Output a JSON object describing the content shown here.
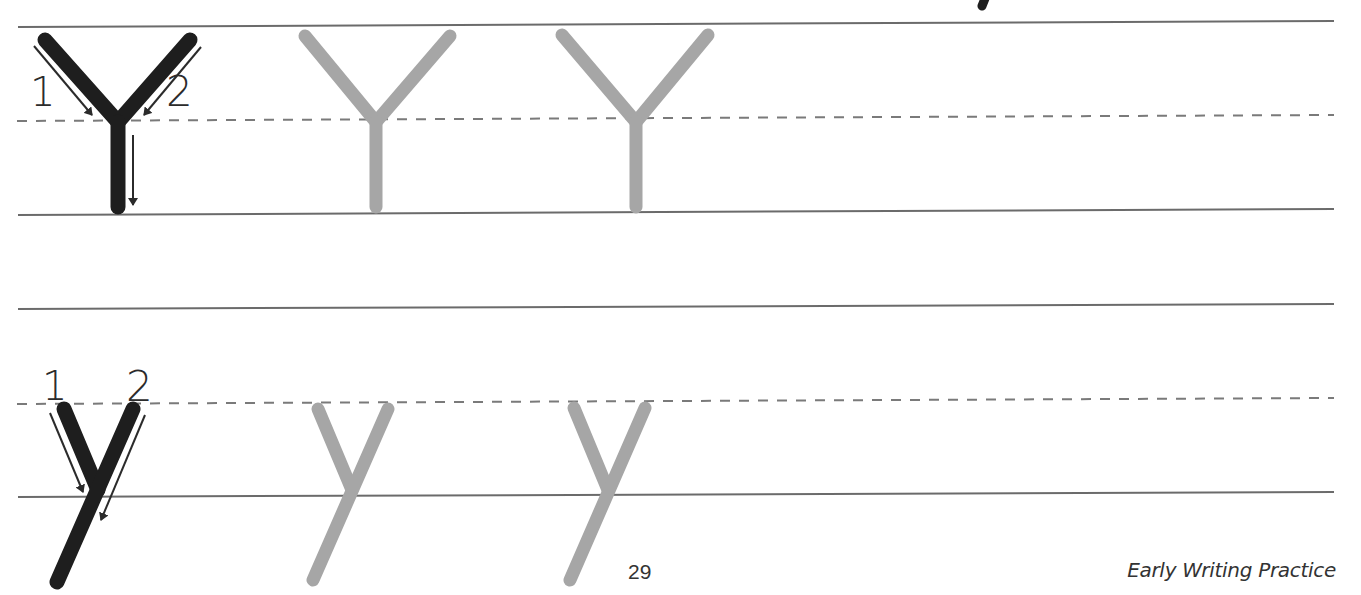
{
  "worksheet": {
    "letter_upper": "Y",
    "letter_lower": "y",
    "page_number": "29",
    "footer_title": "Early Writing Practice",
    "stroke_order_upper": [
      "1",
      "2"
    ],
    "stroke_order_lower": [
      "1",
      "2"
    ],
    "trace_count_upper": 2,
    "trace_count_lower": 2,
    "colors": {
      "model_stroke": "#1e1e1e",
      "trace_stroke": "#a6a6a6",
      "guide_line": "#6b6b6b",
      "arrow": "#2b2b2b"
    }
  }
}
